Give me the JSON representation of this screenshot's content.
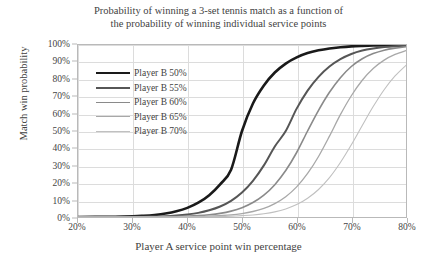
{
  "chart_data": {
    "type": "line",
    "title": "Probability of winning a 3-set tennis match as a function of the probability of winning individual service points",
    "title_line1": "Probability of winning a 3-set tennis match as a function of",
    "title_line2": "the probability of winning individual service points",
    "xlabel": "Player A service point win percentage",
    "ylabel": "Match win probability",
    "xlim": [
      20,
      80
    ],
    "ylim": [
      0,
      100
    ],
    "grid": true,
    "legend_position": "upper-left-inside",
    "xticks": [
      "20%",
      "30%",
      "40%",
      "50%",
      "60%",
      "70%",
      "80%"
    ],
    "xtick_values": [
      20,
      30,
      40,
      50,
      60,
      70,
      80
    ],
    "yticks": [
      "0%",
      "10%",
      "20%",
      "30%",
      "40%",
      "50%",
      "60%",
      "70%",
      "80%",
      "90%",
      "100%"
    ],
    "ytick_values": [
      0,
      10,
      20,
      30,
      40,
      50,
      60,
      70,
      80,
      90,
      100
    ],
    "x": [
      20,
      25,
      30,
      32,
      34,
      36,
      38,
      40,
      42,
      44,
      46,
      48,
      50,
      52,
      54,
      56,
      58,
      60,
      62,
      64,
      66,
      68,
      70,
      72,
      74,
      76,
      78,
      80
    ],
    "series": [
      {
        "name": "Player B 50%",
        "color": "#1a1a1a",
        "width": 2.6,
        "values": [
          0.0,
          0.1,
          0.4,
          0.7,
          1.2,
          2.0,
          3.3,
          5.3,
          8.3,
          12.7,
          19.0,
          27.5,
          50.0,
          66.0,
          76.5,
          84.0,
          89.2,
          92.8,
          95.3,
          96.9,
          98.0,
          98.7,
          99.2,
          99.5,
          99.7,
          99.8,
          99.9,
          100.0
        ]
      },
      {
        "name": "Player B 55%",
        "color": "#565656",
        "width": 2.0,
        "values": [
          0.0,
          0.0,
          0.1,
          0.2,
          0.3,
          0.5,
          0.9,
          1.5,
          2.4,
          3.9,
          6.1,
          9.4,
          14.2,
          21.0,
          30.0,
          41.0,
          50.0,
          63.0,
          73.5,
          81.5,
          87.5,
          91.8,
          94.8,
          96.8,
          98.0,
          98.8,
          99.3,
          99.6
        ]
      },
      {
        "name": "Player B 60%",
        "color": "#8a8a8a",
        "width": 1.6,
        "values": [
          0.0,
          0.0,
          0.0,
          0.1,
          0.1,
          0.2,
          0.3,
          0.5,
          0.8,
          1.3,
          2.1,
          3.4,
          5.4,
          8.4,
          12.7,
          18.8,
          27.0,
          37.5,
          50.0,
          62.0,
          72.5,
          81.0,
          87.5,
          92.0,
          95.0,
          97.0,
          98.2,
          99.0
        ]
      },
      {
        "name": "Player B 65%",
        "color": "#a8a8a8",
        "width": 1.3,
        "values": [
          0.0,
          0.0,
          0.0,
          0.0,
          0.0,
          0.1,
          0.1,
          0.2,
          0.3,
          0.5,
          0.8,
          1.2,
          2.0,
          3.2,
          5.0,
          7.8,
          11.8,
          17.5,
          25.3,
          35.2,
          47.0,
          59.5,
          70.5,
          79.5,
          86.3,
          91.2,
          94.5,
          96.7
        ]
      },
      {
        "name": "Player B 70%",
        "color": "#c0c0c0",
        "width": 1.1,
        "values": [
          0.0,
          0.0,
          0.0,
          0.0,
          0.0,
          0.0,
          0.0,
          0.1,
          0.1,
          0.2,
          0.3,
          0.5,
          0.8,
          1.2,
          1.9,
          3.0,
          4.7,
          7.2,
          10.9,
          16.0,
          22.9,
          31.7,
          42.0,
          53.2,
          64.2,
          74.0,
          82.0,
          88.2
        ]
      }
    ]
  }
}
